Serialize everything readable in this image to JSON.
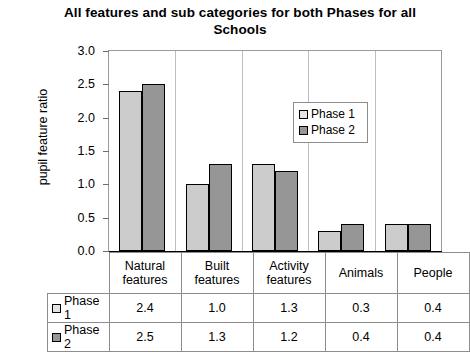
{
  "chart_data": {
    "type": "bar",
    "title": "All features and sub categories for both Phases for all Schools",
    "xlabel": "",
    "ylabel": "pupil feature ratio",
    "ylim": [
      0,
      3.0
    ],
    "ytick_labels": [
      "0.0",
      "0.5",
      "1.0",
      "1.5",
      "2.0",
      "2.5",
      "3.0"
    ],
    "ytick_values": [
      0,
      0.5,
      1.0,
      1.5,
      2.0,
      2.5,
      3.0
    ],
    "grid": false,
    "legend_position": "inside-upper-right",
    "categories": [
      "Natural features",
      "Built features",
      "Activity features",
      "Animals",
      "People"
    ],
    "series": [
      {
        "name": "Phase 1",
        "color": "#cccccc",
        "values": [
          2.4,
          1.0,
          1.3,
          0.3,
          0.4
        ]
      },
      {
        "name": "Phase 2",
        "color": "#969696",
        "values": [
          2.5,
          1.3,
          1.2,
          0.4,
          0.4
        ]
      }
    ],
    "data_table": {
      "row_labels": [
        "Phase 1",
        "Phase 2"
      ],
      "column_headers": [
        "Natural features",
        "Built features",
        "Activity features",
        "Animals",
        "People"
      ],
      "rows": [
        [
          "2.4",
          "1.0",
          "1.3",
          "0.3",
          "0.4"
        ],
        [
          "2.5",
          "1.3",
          "1.2",
          "0.4",
          "0.4"
        ]
      ]
    }
  },
  "legend": {
    "items": [
      {
        "label": "Phase 1",
        "swatch": "legend-swatch-phase-1"
      },
      {
        "label": "Phase 2",
        "swatch": "legend-swatch-phase-2"
      }
    ]
  }
}
